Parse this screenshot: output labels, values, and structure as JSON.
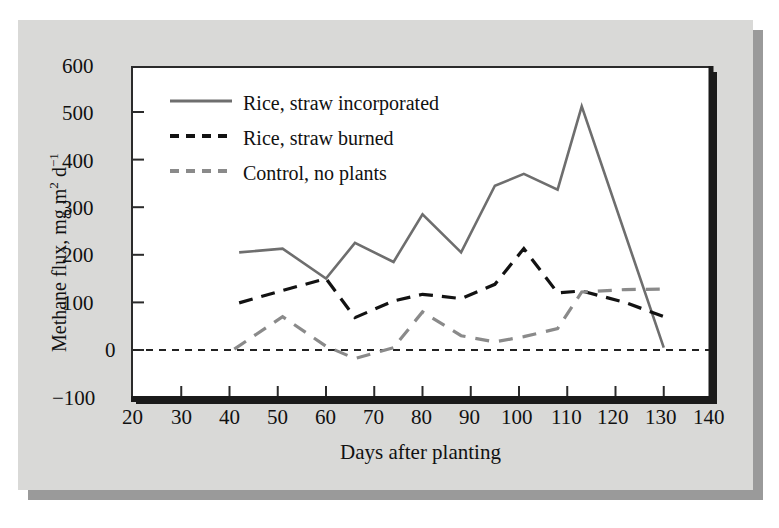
{
  "figure": {
    "background_color": "#d9d9d7",
    "plot_background_color": "#ffffff",
    "shadow_color": "#9a9a9a"
  },
  "chart_data": {
    "type": "line",
    "title": "",
    "xlabel": "Days after planting",
    "ylabel": "Methane flux, mg m2 d-1",
    "ylabel_parts": {
      "prefix": "Methane flux, mg m",
      "sup1": "2",
      "mid": " d",
      "sup2": "−1"
    },
    "xlim": [
      20,
      140
    ],
    "ylim": [
      -100,
      600
    ],
    "xticks": [
      20,
      30,
      40,
      50,
      60,
      70,
      80,
      90,
      100,
      110,
      120,
      130,
      140
    ],
    "yticks": [
      -100,
      0,
      100,
      200,
      300,
      400,
      500,
      600
    ],
    "xtick_labels": [
      "20",
      "30",
      "40",
      "50",
      "60",
      "70",
      "80",
      "90",
      "100",
      "110",
      "120",
      "130",
      "140"
    ],
    "ytick_labels": [
      "−100",
      "0",
      "100",
      "200",
      "300",
      "400",
      "500",
      "600"
    ],
    "grid": false,
    "legend_position": "upper-left-inside",
    "zero_reference_line": {
      "value": 0,
      "style": "fine-dashed",
      "color": "#222222"
    },
    "series": [
      {
        "name": "Rice, straw incorporated",
        "color": "#6e6e6e",
        "style": "solid",
        "width": 2.6,
        "x": [
          42,
          51,
          60,
          66,
          74,
          80,
          88,
          95,
          101,
          108,
          113,
          130
        ],
        "y": [
          205,
          213,
          150,
          225,
          185,
          285,
          205,
          345,
          370,
          337,
          512,
          5
        ]
      },
      {
        "name": "Rice, straw burned",
        "color": "#121212",
        "style": "dashed",
        "width": 3.2,
        "x": [
          42,
          51,
          60,
          66,
          74,
          80,
          88,
          95,
          101,
          108,
          113,
          122,
          130
        ],
        "y": [
          99,
          125,
          150,
          68,
          103,
          117,
          108,
          138,
          213,
          120,
          124,
          100,
          70
        ]
      },
      {
        "name": "Control, no plants",
        "color": "#8a8a8a",
        "style": "dashed",
        "width": 3.2,
        "x": [
          41,
          51,
          60,
          66,
          74,
          80,
          88,
          95,
          101,
          108,
          113,
          122,
          130
        ],
        "y": [
          2,
          70,
          8,
          -18,
          5,
          80,
          30,
          17,
          28,
          45,
          122,
          127,
          128
        ]
      }
    ],
    "legend": [
      {
        "label": "Rice, straw incorporated",
        "color": "#6e6e6e",
        "style": "solid"
      },
      {
        "label": "Rice, straw burned",
        "color": "#121212",
        "style": "dashed"
      },
      {
        "label": "Control, no plants",
        "color": "#8a8a8a",
        "style": "dashed"
      }
    ]
  }
}
